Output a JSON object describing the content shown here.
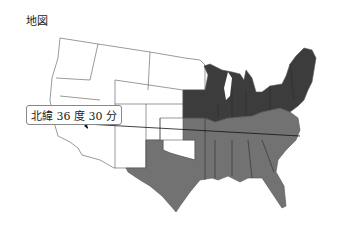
{
  "map": {
    "title": "地図",
    "annotation": "北緯 36 度 30 分",
    "colors": {
      "free_states": "#3c3c3c",
      "slave_states": "#727272",
      "territories": "#ffffff",
      "border": "#444444",
      "line": "#111111"
    },
    "legend_regions": [
      "north-dark",
      "south-gray",
      "west-white"
    ]
  }
}
